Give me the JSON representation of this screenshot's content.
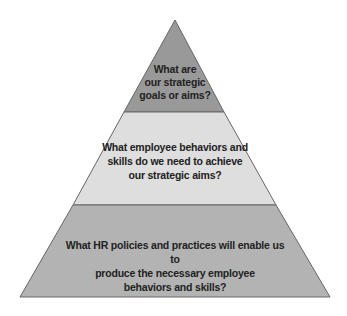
{
  "diagram": {
    "type": "pyramid",
    "colors": {
      "top_fill": "#999999",
      "middle_fill": "#dedede",
      "bottom_fill": "#b3b3b3",
      "stroke": "#555555",
      "text": "#222222"
    },
    "levels": [
      {
        "position": "top",
        "lines": [
          "What are",
          "our strategic",
          "goals or aims?"
        ]
      },
      {
        "position": "middle",
        "lines": [
          "What employee behaviors and",
          "skills do we need to achieve",
          "our strategic aims?"
        ]
      },
      {
        "position": "bottom",
        "lines": [
          "What HR policies and practices will enable us to",
          "produce the necessary employee",
          "behaviors and skills?"
        ]
      }
    ]
  }
}
